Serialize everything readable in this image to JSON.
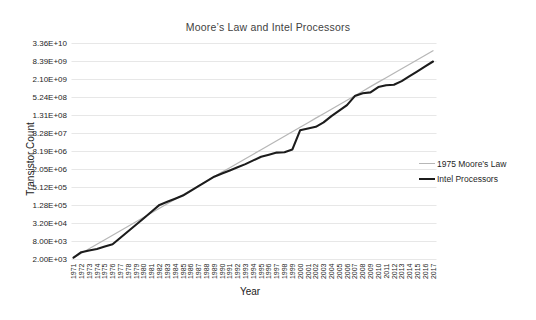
{
  "chart_data": {
    "type": "line",
    "title": "Moore’s Law and Intel Processors",
    "xlabel": "Year",
    "ylabel": "Transistor Count",
    "y_scale": "log",
    "grid": true,
    "legend_position": "right",
    "x_range": [
      1971,
      2017
    ],
    "x_tick_labels": [
      "1971",
      "1972",
      "1973",
      "1974",
      "1975",
      "1976",
      "1977",
      "1978",
      "1979",
      "1980",
      "1981",
      "1982",
      "1983",
      "1984",
      "1985",
      "1986",
      "1987",
      "1988",
      "1989",
      "1990",
      "1991",
      "1992",
      "1993",
      "1994",
      "1995",
      "1996",
      "1997",
      "1998",
      "1999",
      "2000",
      "2001",
      "2002",
      "2003",
      "2004",
      "2005",
      "2006",
      "2007",
      "2008",
      "2009",
      "2010",
      "2011",
      "2012",
      "2013",
      "2014",
      "2015",
      "2016",
      "2017"
    ],
    "y_ticks": [
      {
        "label": "3.36E+10",
        "value": 33554432000
      },
      {
        "label": "8.39E+09",
        "value": 8388608000
      },
      {
        "label": "2.10E+09",
        "value": 2097152000
      },
      {
        "label": "5.24E+08",
        "value": 524288000
      },
      {
        "label": "1.31E+08",
        "value": 131072000
      },
      {
        "label": "3.28E+07",
        "value": 32768000
      },
      {
        "label": "8.19E+06",
        "value": 8192000
      },
      {
        "label": "2.05E+06",
        "value": 2048000
      },
      {
        "label": "5.12E+05",
        "value": 512000
      },
      {
        "label": "1.28E+05",
        "value": 128000
      },
      {
        "label": "3.20E+04",
        "value": 32000
      },
      {
        "label": "8.00E+03",
        "value": 8000
      },
      {
        "label": "2.00E+03",
        "value": 2000
      }
    ],
    "x": [
      1971,
      1972,
      1973,
      1974,
      1975,
      1976,
      1977,
      1978,
      1979,
      1980,
      1981,
      1982,
      1983,
      1984,
      1985,
      1986,
      1987,
      1988,
      1989,
      1990,
      1991,
      1992,
      1993,
      1994,
      1995,
      1996,
      1997,
      1998,
      1999,
      2000,
      2001,
      2002,
      2003,
      2004,
      2005,
      2006,
      2007,
      2008,
      2009,
      2010,
      2011,
      2012,
      2013,
      2014,
      2015,
      2016,
      2017
    ],
    "series": [
      {
        "name": "1975 Moore’s Law",
        "color": "#b7b7b7",
        "stroke_width": 1.3,
        "values": [
          2300,
          3250,
          4600,
          6510,
          9200,
          13000,
          18400,
          26000,
          36800,
          52000,
          73600,
          104000,
          147000,
          208000,
          294000,
          416000,
          589000,
          833000,
          1180000,
          1670000,
          2360000,
          3330000,
          4710000,
          6660000,
          9420000,
          13300000,
          18800000,
          26600000,
          37700000,
          53300000,
          75400000,
          107000000,
          151000000,
          213000000,
          301000000,
          426000000,
          603000000,
          853000000,
          1210000000,
          1710000000,
          2410000000,
          3410000000,
          4820000000,
          6820000000,
          9650000000,
          13600000000,
          19300000000
        ]
      },
      {
        "name": "Intel Processors",
        "color": "#1c1c1c",
        "stroke_width": 2.1,
        "values": [
          2300,
          3500,
          4000,
          4500,
          5400,
          6500,
          10700,
          17600,
          29000,
          48300,
          80500,
          134000,
          170000,
          216000,
          275000,
          396000,
          570000,
          820000,
          1180000,
          1500000,
          1910000,
          2430000,
          3100000,
          4130000,
          5500000,
          6400000,
          7500000,
          7700000,
          9500000,
          42000000,
          48000000,
          55000000,
          77000000,
          125000000,
          190000000,
          291000000,
          582000000,
          731000000,
          774000000,
          1170000000,
          1350000000,
          1400000000,
          1860000000,
          2700000000,
          3950000000,
          5760000000,
          8400000000
        ]
      }
    ],
    "colors": {
      "gridline": "#e7e7e7",
      "tick_text": "#262626",
      "title_text": "#3f3f3f"
    }
  }
}
